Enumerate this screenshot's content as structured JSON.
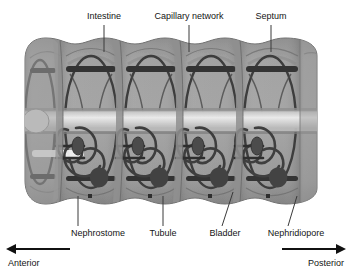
{
  "figure": {
    "body_fill": "#9b9b9b",
    "body_fill_dark": "#8a8a8a",
    "body_shade": "#7c7c7c",
    "vessel_color": "#3d3d3d",
    "intestine_color": "#efefef",
    "background": "#ffffff"
  },
  "labels_top": [
    {
      "id": "intestine",
      "text": "Intestine",
      "x": 104,
      "y": 18,
      "leader_x": 104,
      "leader_y1": 24,
      "leader_y2": 52
    },
    {
      "id": "capillary-network",
      "text": "Capillary network",
      "x": 189,
      "y": 18,
      "leader_x": 189,
      "leader_y1": 24,
      "leader_y2": 52
    },
    {
      "id": "septum",
      "text": "Septum",
      "x": 271,
      "y": 18,
      "leader_x": 271,
      "leader_y1": 24,
      "leader_y2": 52
    }
  ],
  "labels_bottom": [
    {
      "id": "nephrostome",
      "text": "Nephrostome",
      "x": 98,
      "y": 233,
      "lx1": 78,
      "ly1": 226,
      "lx2": 78,
      "ly2": 196
    },
    {
      "id": "tubule",
      "text": "Tubule",
      "x": 163,
      "y": 233,
      "lx1": 163,
      "ly1": 226,
      "lx2": 163,
      "ly2": 196
    },
    {
      "id": "bladder",
      "text": "Bladder",
      "x": 225,
      "y": 233,
      "lx1": 222,
      "ly1": 226,
      "lx2": 233,
      "ly2": 192
    },
    {
      "id": "nephridiopore",
      "text": "Nephridiopore",
      "x": 296,
      "y": 233,
      "lx1": 288,
      "ly1": 226,
      "lx2": 297,
      "ly2": 196
    }
  ],
  "direction": {
    "anterior": {
      "text": "Anterior",
      "x": 30,
      "y": 266
    },
    "posterior": {
      "text": "Posterior",
      "x": 322,
      "y": 266
    },
    "axis_y": 249,
    "left_arrow_x1": 70,
    "left_arrow_x2": 10,
    "right_arrow_x1": 282,
    "right_arrow_x2": 342
  },
  "segments": {
    "count": 5,
    "x_positions": [
      60,
      120,
      180,
      240,
      297
    ],
    "septa_x": [
      60,
      120,
      180,
      240
    ],
    "pore_dots_x": [
      90,
      150,
      210,
      268
    ],
    "pore_dots_y": 196
  }
}
